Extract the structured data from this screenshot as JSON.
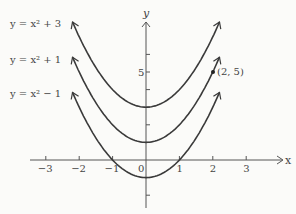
{
  "chart_data": {
    "type": "line",
    "title": "",
    "xlabel": "x",
    "ylabel": "y",
    "xlim": [
      -3.5,
      3.8
    ],
    "ylim": [
      -2.6,
      7.9
    ],
    "grid": false,
    "x_ticks": [
      "-3",
      "-2",
      "-1",
      "0",
      "1",
      "2",
      "3"
    ],
    "y_ticks_labeled": [
      "5"
    ],
    "series": [
      {
        "name": "y = x² + 3",
        "formula": "x^2+3",
        "x_range": [
          -2.2,
          2.2
        ],
        "vertex": [
          0,
          3
        ]
      },
      {
        "name": "y = x² + 1",
        "formula": "x^2+1",
        "x_range": [
          -2.2,
          2.2
        ],
        "vertex": [
          0,
          1
        ]
      },
      {
        "name": "y = x² − 1",
        "formula": "x^2-1",
        "x_range": [
          -2.2,
          2.2
        ],
        "vertex": [
          0,
          -1
        ]
      }
    ],
    "annotations": [
      {
        "point": [
          2,
          5
        ],
        "label": "(2, 5)"
      }
    ]
  },
  "labels": {
    "curve1": "y = x² + 3",
    "curve2": "y = x² + 1",
    "curve3": "y = x² − 1",
    "point": "(2, 5)",
    "x_axis": "x",
    "y_axis": "y",
    "x_ticks": [
      "−3",
      "−2",
      "−1",
      "0",
      "1",
      "2",
      "3"
    ],
    "y_tick5": "5"
  }
}
